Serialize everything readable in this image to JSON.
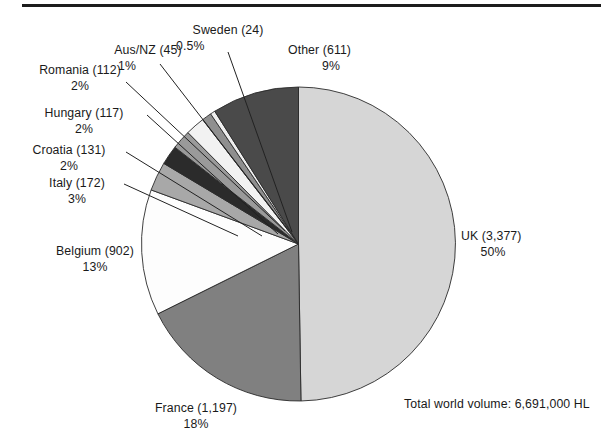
{
  "figure": {
    "top_rule": true,
    "total_note": "Total world volume: 6,691,000 HL"
  },
  "chart_data": {
    "type": "pie",
    "title": "",
    "total_label": "Total world volume: 6,691,000 HL",
    "total_value": 6691000,
    "units": "HL",
    "legend": "none (direct labels with leader lines)",
    "start_angle_deg": 90,
    "direction": "clockwise",
    "categories": [
      "UK",
      "France",
      "Belgium",
      "Italy",
      "Croatia",
      "Hungary",
      "Romania",
      "Aus/NZ",
      "Sweden",
      "Other"
    ],
    "values": [
      3377,
      1197,
      902,
      172,
      131,
      117,
      112,
      45,
      24,
      611
    ],
    "percents": [
      50,
      18,
      13,
      3,
      2,
      2,
      2,
      1,
      0.5,
      9
    ],
    "percent_labels": [
      "50%",
      "18%",
      "13%",
      "3%",
      "2%",
      "2%",
      "2%",
      "1%",
      "0.5%",
      "9%"
    ],
    "value_labels": [
      "(3,377)",
      "(1,197)",
      "(902)",
      "(172)",
      "(131)",
      "(117)",
      "(112)",
      "(45)",
      "(24)",
      "(611)"
    ],
    "colors": [
      "#d6d6d6",
      "#808080",
      "#fdfdfd",
      "#a8a8a8",
      "#2b2b2b",
      "#9a9a9a",
      "#f2f2f2",
      "#8f8f8f",
      "#efefef",
      "#4a4a4a"
    ],
    "slices": [
      {
        "label": "UK (3,377)",
        "name": "UK",
        "value_label": "(3,377)",
        "percent_label": "50%",
        "value": 3377,
        "percent": 50,
        "color": "#d6d6d6"
      },
      {
        "label": "France (1,197)",
        "name": "France",
        "value_label": "(1,197)",
        "percent_label": "18%",
        "value": 1197,
        "percent": 18,
        "color": "#808080"
      },
      {
        "label": "Belgium (902)",
        "name": "Belgium",
        "value_label": "(902)",
        "percent_label": "13%",
        "value": 902,
        "percent": 13,
        "color": "#fdfdfd"
      },
      {
        "label": "Italy (172)",
        "name": "Italy",
        "value_label": "(172)",
        "percent_label": "3%",
        "value": 172,
        "percent": 3,
        "color": "#a8a8a8"
      },
      {
        "label": "Croatia (131)",
        "name": "Croatia",
        "value_label": "(131)",
        "percent_label": "2%",
        "value": 131,
        "percent": 2,
        "color": "#2b2b2b"
      },
      {
        "label": "Hungary (117)",
        "name": "Hungary",
        "value_label": "(117)",
        "percent_label": "2%",
        "value": 117,
        "percent": 2,
        "color": "#9a9a9a"
      },
      {
        "label": "Romania (112)",
        "name": "Romania",
        "value_label": "(112)",
        "percent_label": "2%",
        "value": 112,
        "percent": 2,
        "color": "#f2f2f2"
      },
      {
        "label": "Aus/NZ (45)",
        "name": "Aus/NZ",
        "value_label": "(45)",
        "percent_label": "1%",
        "value": 45,
        "percent": 1,
        "color": "#8f8f8f"
      },
      {
        "label": "Sweden (24)",
        "name": "Sweden",
        "value_label": "(24)",
        "percent_label": "0.5%",
        "value": 24,
        "percent": 0.5,
        "color": "#efefef"
      },
      {
        "label": "Other (611)",
        "name": "Other",
        "value_label": "(611)",
        "percent_label": "9%",
        "value": 611,
        "percent": 9,
        "color": "#4a4a4a"
      }
    ]
  },
  "labels": {
    "uk": {
      "name": "UK (3,377)",
      "pct": "50%"
    },
    "france": {
      "name": "France (1,197)",
      "pct": "18%"
    },
    "belgium": {
      "name": "Belgium (902)",
      "pct": "13%"
    },
    "italy": {
      "name": "Italy (172)",
      "pct": "3%"
    },
    "croatia": {
      "name": "Croatia (131)",
      "pct": "2%"
    },
    "hungary": {
      "name": "Hungary (117)",
      "pct": "2%"
    },
    "romania": {
      "name": "Romania (112)",
      "pct": "2%"
    },
    "ausnz": {
      "name": "Aus/NZ (45)",
      "pct": "1%"
    },
    "sweden": {
      "name": "Sweden (24)",
      "pct": "0.5%"
    },
    "other": {
      "name": "Other (611)",
      "pct": "9%"
    }
  }
}
